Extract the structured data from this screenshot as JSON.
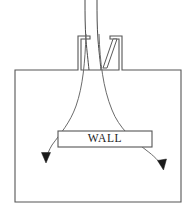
{
  "diagram": {
    "background_color": "#ffffff",
    "line_color": "#555555",
    "streamline_color": "#6b6b6b",
    "arrow_color": "#1a1a1a",
    "canvas": {
      "width": 195,
      "height": 213
    },
    "labels": {
      "wall": "WALL"
    },
    "parts": {
      "chamber_name": "chamber-outline",
      "neck_name": "inlet-neck",
      "vane_name": "inlet-vane",
      "wall_box_name": "wall-block",
      "left_streamline_name": "left-streamline",
      "right_streamline_name": "right-streamline",
      "left_arrow_name": "left-flow-arrow",
      "right_arrow_name": "right-flow-arrow"
    },
    "geometry": {
      "chamber_left": 15,
      "chamber_right": 181,
      "chamber_top": 70,
      "chamber_bottom": 202,
      "neck_left": 78,
      "neck_right": 122,
      "neck_top": 36,
      "wall_box_left": 58,
      "wall_box_right": 152,
      "wall_box_top": 131,
      "wall_box_bottom": 147,
      "left_arrow_tip_x": 45,
      "left_arrow_tip_y": 162,
      "right_arrow_tip_x": 163,
      "right_arrow_tip_y": 169
    }
  }
}
